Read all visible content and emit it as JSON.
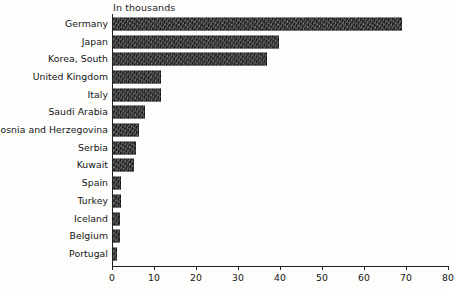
{
  "chart_data": {
    "type": "bar",
    "orientation": "horizontal",
    "title": "",
    "subtitle": "",
    "unit_caption": "In thousands",
    "xlabel": "",
    "ylabel": "",
    "xlim": [
      0,
      80
    ],
    "xticks": [
      0,
      10,
      20,
      30,
      40,
      50,
      60,
      70,
      80
    ],
    "xtick_labels": [
      "0",
      "10",
      "20",
      "30",
      "40",
      "50",
      "60",
      "70",
      "80"
    ],
    "grid": false,
    "legend": null,
    "bar_color": "#2b2b2b",
    "background_color": "#fdfdfc",
    "axis_color": "#202020",
    "categories": [
      "Germany",
      "Japan",
      "Korea, South",
      "United Kingdom",
      "Italy",
      "Saudi Arabia",
      "Bosnia and Herzegovina",
      "Serbia",
      "Kuwait",
      "Spain",
      "Turkey",
      "Iceland",
      "Belgium",
      "Portugal"
    ],
    "values": [
      69,
      39.8,
      37,
      11.7,
      11.7,
      7.9,
      6.4,
      5.7,
      5.2,
      2.2,
      2.1,
      2.0,
      2.0,
      1.2
    ],
    "series": [
      {
        "name": "",
        "values": [
          69,
          39.8,
          37,
          11.7,
          11.7,
          7.9,
          6.4,
          5.7,
          5.2,
          2.2,
          2.1,
          2.0,
          2.0,
          1.2
        ]
      }
    ]
  }
}
